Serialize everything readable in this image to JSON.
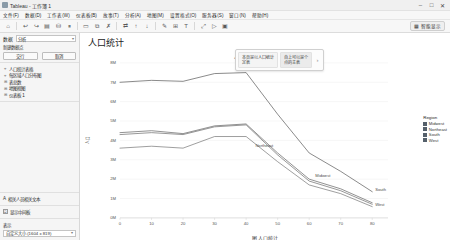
{
  "window": {
    "title": "Tableau - 工作簿 1",
    "app_icon": "tableau-icon",
    "minimize": "–",
    "maximize": "□",
    "close": "✕"
  },
  "menubar": {
    "items": [
      {
        "label": "文件(F)"
      },
      {
        "label": "数据(D)"
      },
      {
        "label": "工作表(W)"
      },
      {
        "label": "仪表板(B)"
      },
      {
        "label": "故事(T)"
      },
      {
        "label": "分析(A)"
      },
      {
        "label": "地图(M)"
      },
      {
        "label": "设置格式(O)"
      },
      {
        "label": "服务器(S)"
      },
      {
        "label": "窗口(N)"
      },
      {
        "label": "帮助(H)"
      }
    ]
  },
  "toolbar": {
    "buttons": [
      {
        "name": "tableau-home-icon",
        "glyph": "⌂"
      },
      {
        "name": "undo-icon",
        "glyph": "↩"
      },
      {
        "name": "redo-icon",
        "glyph": "↪"
      },
      {
        "name": "save-icon",
        "glyph": "▤"
      },
      {
        "name": "new-data-source-icon",
        "glyph": "⛁"
      },
      {
        "name": "pause-refresh-icon",
        "glyph": "⏸"
      },
      {
        "name": "new-worksheet-icon",
        "glyph": "▭"
      },
      {
        "name": "duplicate-sheet-icon",
        "glyph": "⧉"
      },
      {
        "name": "clear-sheet-icon",
        "glyph": "✗"
      },
      {
        "name": "swap-rows-columns-icon",
        "glyph": "⇄"
      },
      {
        "name": "sort-ascending-icon",
        "glyph": "↑"
      },
      {
        "name": "sort-descending-icon",
        "glyph": "↓"
      },
      {
        "name": "highlight-icon",
        "glyph": "✎"
      },
      {
        "name": "group-members-icon",
        "glyph": "⊞"
      },
      {
        "name": "show-mark-labels-icon",
        "glyph": "T"
      },
      {
        "name": "fix-axes-icon",
        "glyph": "⤢"
      },
      {
        "name": "presentation-mode-icon",
        "glyph": "▷"
      },
      {
        "name": "fit-selector-icon",
        "glyph": "▣"
      }
    ],
    "show_me_label": "智能显示",
    "show_me_icon": "show-me-icon"
  },
  "sidebar": {
    "data_panel": {
      "label": "数据",
      "select_value": "分析",
      "caret": "▾"
    },
    "new_datasource": {
      "label": "新建数据点",
      "ok_button": "交行",
      "cancel_button": "取消"
    },
    "fields": [
      {
        "bullet": "⌖",
        "label": "人口统计表格"
      },
      {
        "bullet": "⌖",
        "label": "每区域人口分布图"
      },
      {
        "bullet": "⊞",
        "label": "表总数"
      },
      {
        "bullet": "⊞",
        "label": "地图视图"
      },
      {
        "bullet": "⊞",
        "label": "仪表板 1"
      }
    ],
    "marks_card": {
      "icon": "text-icon",
      "label": "相关人员相关文本"
    },
    "filter_card": {
      "checkbox": "☑",
      "label": "显示中间板"
    },
    "footer": {
      "label": "表示",
      "size_value": "自定义大小 (1604 x 819)",
      "caret": "▾"
    }
  },
  "sheet": {
    "title": "人口统计",
    "popup_card": {
      "cells": [
        "本页是以人口统计\n定表",
        "自上可以是个\n点的主表"
      ],
      "arrow": "›"
    }
  },
  "chart_data": {
    "type": "line",
    "title": "4 和（与分布）",
    "xlabel": "",
    "ylabel": "人口",
    "xlim": [
      0,
      85
    ],
    "ylim": [
      0,
      8
    ],
    "xticks": [
      0,
      10,
      20,
      30,
      40,
      50,
      60,
      70,
      80
    ],
    "yticks": [
      0,
      1,
      2,
      3,
      4,
      5,
      6,
      7,
      8
    ],
    "ytick_labels": [
      "0M",
      "1M",
      "2M",
      "3M",
      "4M",
      "5M",
      "6M",
      "7M",
      "8M"
    ],
    "xtick_labels": [
      "0",
      "10",
      "20",
      "30",
      "40",
      "50",
      "60",
      "70",
      "80"
    ],
    "grid": true,
    "legend_position": "right",
    "legend_title": "Region",
    "x": [
      0,
      10,
      20,
      30,
      40,
      50,
      60,
      70,
      80
    ],
    "series": [
      {
        "name": "South",
        "color": "#4a4a4a",
        "values": [
          7.0,
          7.1,
          7.05,
          7.45,
          7.5,
          5.35,
          3.35,
          2.4,
          1.35
        ],
        "label_x": 80,
        "label_y": 1.35
      },
      {
        "name": "Northeast",
        "color": "#555555",
        "values": [
          4.4,
          4.5,
          4.35,
          4.75,
          4.85,
          3.35,
          2.0,
          1.5,
          0.78
        ],
        "label_x": 42,
        "label_y": 3.6
      },
      {
        "name": "Midwest",
        "color": "#5f5f5f",
        "values": [
          4.3,
          4.4,
          4.3,
          4.7,
          4.8,
          3.25,
          1.9,
          1.4,
          0.7
        ],
        "label_x": 61,
        "label_y": 2.05
      },
      {
        "name": "West",
        "color": "#6a6a6a",
        "values": [
          3.6,
          3.7,
          3.6,
          4.2,
          4.2,
          2.9,
          1.7,
          1.25,
          0.58
        ],
        "label_x": 80,
        "label_y": 0.55
      }
    ],
    "legend_entries": [
      {
        "label": "Midwest",
        "color": "#55606b"
      },
      {
        "label": "Northeast",
        "color": "#55606b"
      },
      {
        "label": "South",
        "color": "#55606b"
      },
      {
        "label": "West",
        "color": "#55606b"
      }
    ]
  },
  "figure": {
    "caption": "图  人口统计"
  }
}
